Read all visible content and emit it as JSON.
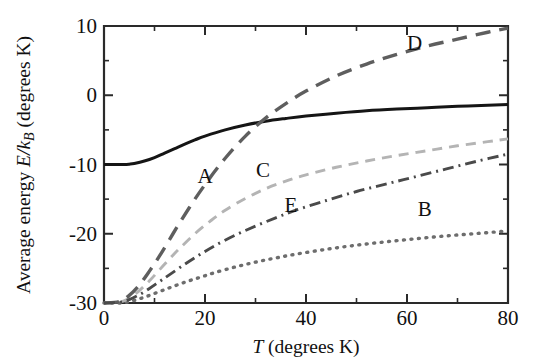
{
  "figure": {
    "background": "#ffffff",
    "plot_box": {
      "left": 104,
      "top": 26,
      "right": 508,
      "bottom": 303
    }
  },
  "chart_data": {
    "type": "line",
    "title": "",
    "xlabel": "T (degrees K)",
    "xlabel_parts": {
      "symbol": "T",
      "rest": " (degrees K)"
    },
    "ylabel": "Average energy E/k_B (degrees K)",
    "ylabel_parts": {
      "prefix": "Average energy ",
      "symbol_e": "E",
      "slash": "/",
      "symbol_k": "k",
      "sub_b": "B",
      "rest": " (degrees K)"
    },
    "xlim": [
      0,
      80
    ],
    "ylim": [
      -30,
      10
    ],
    "xticks": [
      0,
      20,
      40,
      60,
      80
    ],
    "xticklabels": [
      "0",
      "20",
      "40",
      "60",
      "80"
    ],
    "xminorticks": [
      10,
      30,
      50,
      70
    ],
    "yticks": [
      10,
      0,
      -10,
      -20,
      -30
    ],
    "yticklabels": [
      "10",
      "0",
      "-10",
      "-20",
      "-30"
    ],
    "yminorticks": [
      5,
      -5,
      -15,
      -25
    ],
    "grid": false,
    "legend": "inline-curve-labels",
    "series": [
      {
        "name": "A",
        "label": "A",
        "label_x": 20.0,
        "label_y": -12.6,
        "color": "#151515",
        "linestyle": "solid",
        "dasharray": "",
        "width": 3.0,
        "x": [
          0,
          2,
          4,
          5,
          6,
          8,
          10,
          12,
          14,
          16,
          18,
          20,
          24,
          28,
          32,
          36,
          40,
          46,
          52,
          58,
          64,
          70,
          76,
          80
        ],
        "y": [
          -10.0,
          -10.0,
          -10.0,
          -9.95,
          -9.85,
          -9.5,
          -9.0,
          -8.35,
          -7.7,
          -7.05,
          -6.45,
          -5.9,
          -5.0,
          -4.3,
          -3.75,
          -3.35,
          -3.0,
          -2.6,
          -2.25,
          -2.0,
          -1.8,
          -1.6,
          -1.45,
          -1.35
        ]
      },
      {
        "name": "B",
        "label": "B",
        "label_x": 63.5,
        "label_y": -17.4,
        "color": "#6d6d6d",
        "linestyle": "dotted",
        "dasharray": "1 6.5",
        "width": 3.4,
        "x": [
          0,
          3,
          5,
          7,
          9,
          11,
          13,
          16,
          19,
          22,
          26,
          30,
          34,
          38,
          44,
          50,
          56,
          62,
          68,
          74,
          80
        ],
        "y": [
          -30.0,
          -30.0,
          -29.8,
          -29.4,
          -28.9,
          -28.35,
          -27.8,
          -27.0,
          -26.3,
          -25.6,
          -24.8,
          -24.1,
          -23.5,
          -22.95,
          -22.25,
          -21.65,
          -21.15,
          -20.7,
          -20.3,
          -19.95,
          -19.6
        ]
      },
      {
        "name": "C",
        "label": "C",
        "label_x": 31.5,
        "label_y": -11.8,
        "color": "#b4b4b4",
        "linestyle": "dashed",
        "dasharray": "10 7",
        "width": 2.9,
        "x": [
          0,
          3,
          5,
          7,
          9,
          11,
          13,
          15,
          18,
          21,
          24,
          28,
          32,
          36,
          40,
          46,
          52,
          58,
          64,
          70,
          76,
          80
        ],
        "y": [
          -30.0,
          -29.9,
          -29.3,
          -28.2,
          -26.8,
          -25.2,
          -23.6,
          -22.1,
          -20.0,
          -18.2,
          -16.6,
          -14.9,
          -13.5,
          -12.4,
          -11.5,
          -10.4,
          -9.5,
          -8.7,
          -8.0,
          -7.3,
          -6.7,
          -6.3
        ]
      },
      {
        "name": "D",
        "label": "D",
        "label_x": 61.5,
        "label_y": 6.5,
        "color": "#5e5e5e",
        "linestyle": "longdash",
        "dasharray": "15 9",
        "width": 3.4,
        "x": [
          0,
          3,
          5,
          7,
          9,
          11,
          13,
          15,
          18,
          21,
          24,
          28,
          32,
          36,
          40,
          46,
          52,
          58,
          64,
          70,
          76,
          80
        ],
        "y": [
          -30.0,
          -29.8,
          -28.9,
          -27.4,
          -25.4,
          -23.2,
          -20.8,
          -18.4,
          -15.0,
          -11.9,
          -9.1,
          -5.9,
          -3.3,
          -1.2,
          0.6,
          2.8,
          4.5,
          5.9,
          7.1,
          8.1,
          9.1,
          9.7
        ]
      },
      {
        "name": "E",
        "label": "E",
        "label_x": 37.0,
        "label_y": -16.8,
        "color": "#4a4a4a",
        "linestyle": "dashdot",
        "dasharray": "11 5 2 5",
        "width": 2.9,
        "x": [
          0,
          3,
          5,
          7,
          9,
          11,
          13,
          16,
          19,
          22,
          26,
          30,
          34,
          38,
          44,
          50,
          56,
          62,
          68,
          74,
          80
        ],
        "y": [
          -30.0,
          -29.9,
          -29.5,
          -28.8,
          -27.9,
          -26.9,
          -25.9,
          -24.4,
          -23.0,
          -21.7,
          -20.2,
          -18.9,
          -17.7,
          -16.6,
          -15.2,
          -13.9,
          -12.8,
          -11.7,
          -10.6,
          -9.5,
          -8.5
        ]
      }
    ]
  }
}
